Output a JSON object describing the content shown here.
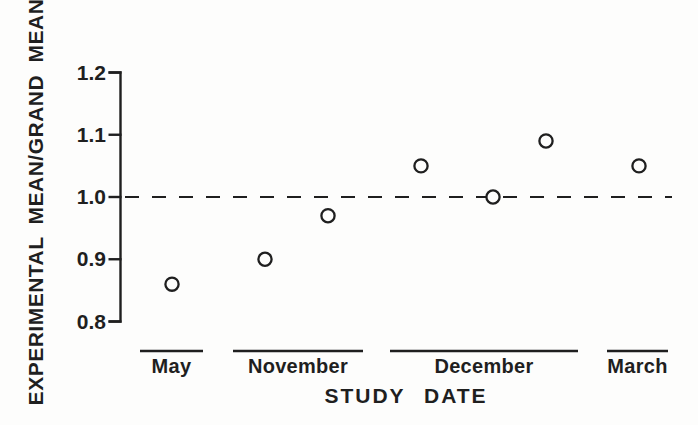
{
  "figure": {
    "background": "#fdfdfc",
    "ink_color": "#1f1f1f"
  },
  "chart_data": {
    "type": "scatter",
    "title": "",
    "ylabel": "EXPERIMENTAL MEAN/GRAND MEAN",
    "xlabel": "STUDY DATE",
    "ylim": [
      0.8,
      1.2
    ],
    "yticks": [
      1.2,
      1.1,
      1.0,
      0.9,
      0.8
    ],
    "ytick_labels": [
      "1.2",
      "1.1",
      "1.0",
      "0.9",
      "0.8"
    ],
    "grid": false,
    "legend": "none",
    "marker": "open-circle",
    "reference_line": {
      "value": 1.0,
      "style": "dashed",
      "label": "grand mean = 1.0"
    },
    "categories": [
      "May",
      "November",
      "December",
      "March"
    ],
    "points": [
      {
        "category": "May",
        "value": 0.86
      },
      {
        "category": "November",
        "value": 0.9
      },
      {
        "category": "November",
        "value": 0.97
      },
      {
        "category": "December",
        "value": 1.05
      },
      {
        "category": "December",
        "value": 1.0
      },
      {
        "category": "December",
        "value": 1.09
      },
      {
        "category": "March",
        "value": 1.05
      }
    ],
    "series": [
      {
        "name": "experimental mean ratio",
        "values_by_category": {
          "May": [
            0.86
          ],
          "November": [
            0.9,
            0.97
          ],
          "December": [
            1.05,
            1.0,
            1.09
          ],
          "March": [
            1.05
          ]
        }
      }
    ]
  }
}
